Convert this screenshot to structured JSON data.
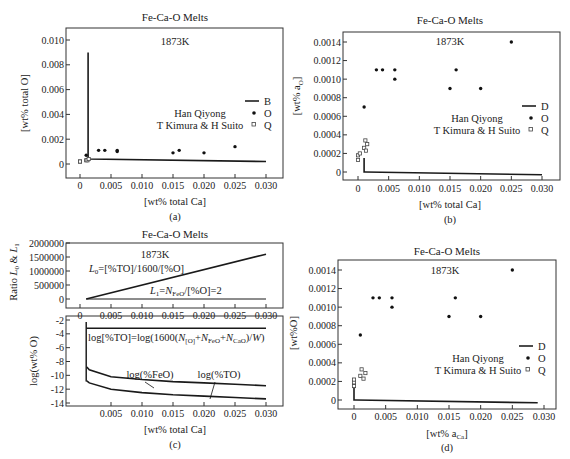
{
  "figure": {
    "panels": [
      {
        "id": "a",
        "caption": "(a)",
        "title": "Fe-Ca-O Melts",
        "temperature": "1873K",
        "xlabel": "[wt% total Ca]",
        "ylabel": "[wt% total O]",
        "yticks": [
          "0.010",
          "0.008",
          "0.006",
          "0.004",
          "0.002",
          "0"
        ],
        "xticks": [
          "0",
          "0.005",
          "0.010",
          "0.015",
          "0.020",
          "0.025",
          "0.030"
        ],
        "legend": {
          "line_label": "B",
          "filled_label": "O",
          "open_label": "Q",
          "source1": "Han Qiyong",
          "source2": "T Kimura & H Suito"
        }
      },
      {
        "id": "b",
        "caption": "(b)",
        "title": "Fe-Ca-O Melts",
        "temperature": "1873K",
        "xlabel": "[wt% total Ca]",
        "ylabel": "[wt% a",
        "ylabel_sub": "O",
        "ylabel_end": "]",
        "yticks": [
          "0.0014",
          "0.0012",
          "0.0010",
          "0.0008",
          "0.0006",
          "0.0004",
          "0.0002",
          "0"
        ],
        "xticks": [
          "0",
          "0.005",
          "0.010",
          "0.015",
          "0.020",
          "0.025",
          "0.030"
        ],
        "legend": {
          "line_label": "D",
          "filled_label": "O",
          "open_label": "Q",
          "source1": "Han Qiyong",
          "source2": "T Kimura & H Suito"
        }
      },
      {
        "id": "c",
        "caption": "(c)",
        "title": "Fe-Ca-O Melts",
        "temperature": "1873K",
        "xlabel": "[wt% total Ca]",
        "top": {
          "ylabel": "Ratio L0 & L1",
          "yticks": [
            "2000000",
            "1500000",
            "1000000",
            "500000",
            "0"
          ],
          "xticks": [
            "0",
            "0.005",
            "0.010",
            "0.015",
            "0.020",
            "0.025",
            "0.030"
          ],
          "eq_L0": "L0=[%TO]/1600/[%O]",
          "eq_L1": "L1=NFeO/[%O]=2"
        },
        "bottom": {
          "ylabel": "log(wt% O)",
          "yticks": [
            "-2",
            "-4",
            "-6",
            "-8",
            "-10",
            "-12",
            "-14"
          ],
          "xticks": [
            "0.005",
            "0.010",
            "0.015",
            "0.020",
            "0.025",
            "0.030"
          ],
          "eq_TO": "log[%TO]=log(1600(N[O]+NFeO+NCaO)/W)",
          "label_feo": "log(%FeO)",
          "label_to": "log(%TO)"
        }
      },
      {
        "id": "d",
        "caption": "(d)",
        "title": "Fe-Ca-O Melts",
        "temperature": "1873K",
        "xlabel": "[wt% a",
        "xlabel_sub": "Ca",
        "xlabel_end": "]",
        "ylabel": "[wt%O]",
        "yticks": [
          "0.0014",
          "0.0012",
          "0.0010",
          "0.0008",
          "0.0006",
          "0.0004",
          "0.0002",
          "0"
        ],
        "xticks": [
          "0",
          "0.005",
          "0.010",
          "0.015",
          "0.020",
          "0.025",
          "0.030"
        ],
        "legend": {
          "line_label": "D",
          "filled_label": "O",
          "open_label": "Q",
          "source1": "Han Qiyong",
          "source2": "T Kimura & H Suito"
        }
      }
    ]
  },
  "chart_data": [
    {
      "type": "scatter",
      "title": "Fe-Ca-O Melts (a) 1873K",
      "xlabel": "[wt% total Ca]",
      "ylabel": "[wt% total O]",
      "xlim": [
        0,
        0.03
      ],
      "ylim": [
        0,
        0.01
      ],
      "series": [
        {
          "name": "B (calculated line)",
          "kind": "line",
          "x": [
            0.0013,
            0.0013,
            0.0015,
            0.03
          ],
          "y": [
            0.009,
            0.0005,
            0.0004,
            0.0002
          ]
        },
        {
          "name": "O (Han Qiyong)",
          "kind": "filled",
          "x": [
            0.001,
            0.003,
            0.004,
            0.006,
            0.006,
            0.015,
            0.016,
            0.02,
            0.025
          ],
          "y": [
            0.0007,
            0.0011,
            0.0011,
            0.0011,
            0.001,
            0.0009,
            0.0011,
            0.0009,
            0.0014
          ]
        },
        {
          "name": "Q (T Kimura & H Suito)",
          "kind": "open",
          "x": [
            0.0,
            0.0,
            0.001,
            0.0012,
            0.0014
          ],
          "y": [
            0.0002,
            0.0002,
            0.0003,
            0.0003,
            0.0004
          ]
        }
      ]
    },
    {
      "type": "scatter",
      "title": "Fe-Ca-O Melts (b) 1873K",
      "xlabel": "[wt% total Ca]",
      "ylabel": "[wt% aO]",
      "xlim": [
        0,
        0.03
      ],
      "ylim": [
        0,
        0.0014
      ],
      "series": [
        {
          "name": "D (calculated line)",
          "kind": "line",
          "x": [
            0.001,
            0.001,
            0.0012,
            0.03
          ],
          "y": [
            0.00015,
            0.0,
            0.0,
            -3e-05
          ]
        },
        {
          "name": "O (Han Qiyong)",
          "kind": "filled",
          "x": [
            0.001,
            0.003,
            0.004,
            0.006,
            0.006,
            0.015,
            0.016,
            0.02,
            0.025
          ],
          "y": [
            0.0007,
            0.0011,
            0.0011,
            0.0011,
            0.001,
            0.0009,
            0.0011,
            0.0009,
            0.0014
          ]
        },
        {
          "name": "Q (T Kimura & H Suito)",
          "kind": "open",
          "x": [
            0.0,
            0.0,
            0.0003,
            0.001,
            0.0013,
            0.0015,
            0.0012
          ],
          "y": [
            0.00013,
            0.00018,
            0.0002,
            0.00026,
            0.00023,
            0.0003,
            0.00034
          ]
        }
      ]
    },
    {
      "type": "line",
      "title": "Fe-Ca-O Melts (c) 1873K — top",
      "xlabel": "[wt% total Ca]",
      "ylabel": "Ratio L0 & L1",
      "xlim": [
        0,
        0.03
      ],
      "ylim": [
        0,
        2000000
      ],
      "series": [
        {
          "name": "L0=[%TO]/1600/[%O]",
          "x": [
            0.001,
            0.03
          ],
          "y": [
            0,
            1600000
          ]
        },
        {
          "name": "L1=NFeO/[%O]=2",
          "x": [
            0.001,
            0.03
          ],
          "y": [
            2,
            2
          ]
        }
      ]
    },
    {
      "type": "line",
      "title": "Fe-Ca-O Melts (c) 1873K — bottom",
      "xlabel": "[wt% total Ca]",
      "ylabel": "log(wt% O)",
      "xlim": [
        0,
        0.03
      ],
      "ylim": [
        -14,
        -2
      ],
      "series": [
        {
          "name": "log[%TO]=log(1600(N[O]+NFeO+NCaO)/W)",
          "x": [
            0.001,
            0.03
          ],
          "y": [
            -3.2,
            -3.2
          ]
        },
        {
          "name": "log(%FeO)",
          "x": [
            0.001,
            0.0011,
            0.0015,
            0.005,
            0.01,
            0.015,
            0.02,
            0.025,
            0.03
          ],
          "y": [
            -2.5,
            -8.8,
            -9.2,
            -10.2,
            -10.6,
            -10.9,
            -11.1,
            -11.3,
            -11.5
          ]
        },
        {
          "name": "log(%TO)",
          "x": [
            0.0011,
            0.0015,
            0.005,
            0.01,
            0.015,
            0.02,
            0.025,
            0.03
          ],
          "y": [
            -10.8,
            -11.1,
            -12.0,
            -12.5,
            -12.8,
            -13.0,
            -13.2,
            -13.4
          ]
        }
      ]
    },
    {
      "type": "scatter",
      "title": "Fe-Ca-O Melts (d) 1873K",
      "xlabel": "[wt% aCa]",
      "ylabel": "[wt%O]",
      "xlim": [
        0,
        0.03
      ],
      "ylim": [
        0,
        0.0014
      ],
      "series": [
        {
          "name": "D (calculated line)",
          "kind": "line",
          "x": [
            0.0,
            0.0,
            0.0003,
            0.029
          ],
          "y": [
            0.00015,
            0.0,
            0.0,
            -3e-05
          ]
        },
        {
          "name": "O (Han Qiyong)",
          "kind": "filled",
          "x": [
            0.001,
            0.003,
            0.004,
            0.006,
            0.006,
            0.015,
            0.016,
            0.02,
            0.025
          ],
          "y": [
            0.0007,
            0.0011,
            0.0011,
            0.0011,
            0.001,
            0.0009,
            0.0011,
            0.0009,
            0.0014
          ]
        },
        {
          "name": "Q (T Kimura & H Suito)",
          "kind": "open",
          "x": [
            0.0,
            0.0,
            0.0,
            0.001,
            0.0015,
            0.0012,
            0.0018
          ],
          "y": [
            0.00015,
            0.00019,
            0.00022,
            0.00026,
            0.00023,
            0.00033,
            0.00029
          ]
        }
      ]
    }
  ]
}
